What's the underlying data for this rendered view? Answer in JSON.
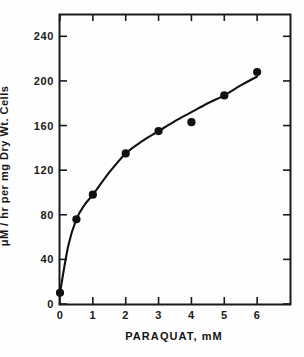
{
  "chart_data": {
    "type": "scatter",
    "title": "",
    "subtitle": "",
    "xlabel": "PARAQUAT, mM",
    "ylabel": "μM / hr per mg Dry Wt. Cells",
    "xlim": [
      0,
      7
    ],
    "ylim": [
      0,
      260
    ],
    "grid": false,
    "legend": null,
    "x_ticks": [
      0,
      1,
      2,
      3,
      4,
      5,
      6
    ],
    "x_tick_labels": [
      "0",
      "1",
      "2",
      "3",
      "4",
      "5",
      "6"
    ],
    "y_ticks": [
      0,
      40,
      80,
      120,
      160,
      200,
      240
    ],
    "y_tick_labels": [
      "0",
      "40",
      "80",
      "120",
      "160",
      "200",
      "240"
    ],
    "marker": "filled-circle",
    "marker_color": "#111111",
    "line_color": "#111111",
    "series": [
      {
        "name": "Paraquat-stimulated rate",
        "x": [
          0,
          0.5,
          1,
          2,
          3,
          4,
          5,
          6
        ],
        "values": [
          10,
          76,
          98,
          135,
          155,
          163,
          187,
          208
        ]
      }
    ],
    "fit_curve": {
      "description": "smooth saturating curve through points",
      "x": [
        0,
        0.25,
        0.5,
        0.75,
        1,
        1.5,
        2,
        2.5,
        3,
        3.5,
        4,
        4.5,
        5,
        5.5,
        6
      ],
      "y": [
        10,
        52,
        76,
        89,
        98,
        118,
        135,
        146,
        155,
        164,
        172,
        180,
        187,
        196,
        204
      ]
    }
  },
  "axis": {
    "x_title": "PARAQUAT, mM",
    "y_title": "μM / hr per mg Dry Wt. Cells"
  }
}
